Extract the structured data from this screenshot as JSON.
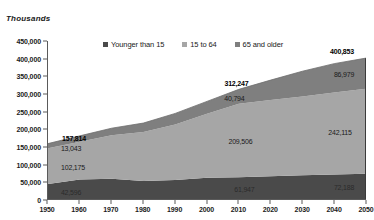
{
  "units_label": "Thousands",
  "legend": {
    "items": [
      {
        "label": "Younger than 15",
        "color": "#4a4a4a",
        "icon": "square-swatch-icon"
      },
      {
        "label": "15 to 64",
        "color": "#a6a6a6",
        "icon": "square-swatch-icon"
      },
      {
        "label": "65 and older",
        "color": "#7f7f7f",
        "icon": "square-swatch-icon"
      }
    ]
  },
  "axes": {
    "y_ticks": [
      "0",
      "50,000",
      "100,000",
      "150,000",
      "200,000",
      "250,000",
      "300,000",
      "350,000",
      "400,000",
      "450,000"
    ],
    "x_ticks": [
      "1950",
      "1960",
      "1970",
      "1980",
      "1990",
      "2000",
      "2010",
      "2020",
      "2030",
      "2040",
      "2050"
    ]
  },
  "annotations": {
    "total_1950": "157,814",
    "older_1950": "13,043",
    "middle_1950": "102,175",
    "young_1950": "42,596",
    "total_2010": "312,247",
    "older_2010": "40,794",
    "middle_2010": "209,506",
    "young_2010": "61,947",
    "total_2050": "400,853",
    "older_2050": "86,979",
    "middle_2050": "242,115",
    "young_2050": "72,188"
  },
  "chart_data": {
    "type": "area",
    "title": "",
    "subtitle": "",
    "xlabel": "",
    "ylabel": "Thousands",
    "ylim": [
      0,
      450000
    ],
    "xlim": [
      1950,
      2050
    ],
    "grid": false,
    "stacked": true,
    "legend_position": "top-center",
    "x": [
      1950,
      1960,
      1970,
      1980,
      1990,
      2000,
      2010,
      2020,
      2030,
      2040,
      2050
    ],
    "series": [
      {
        "name": "Younger than 15",
        "color": "#4a4a4a",
        "values": [
          42596,
          55784,
          57900,
          51290,
          53970,
          60253,
          61947,
          64940,
          67800,
          70100,
          72188
        ]
      },
      {
        "name": "15 to 64",
        "color": "#a6a6a6",
        "values": [
          102175,
          107500,
          123670,
          139470,
          158500,
          182800,
          209506,
          217200,
          224000,
          233500,
          242115
        ]
      },
      {
        "name": "65 and older",
        "color": "#7f7f7f",
        "values": [
          13043,
          16560,
          20066,
          25550,
          31240,
          34990,
          40794,
          56440,
          72090,
          81950,
          86979
        ]
      }
    ],
    "totals": [
      157814,
      179844,
      201636,
      216310,
      243710,
      278043,
      312247,
      338580,
      363890,
      385550,
      400853
    ],
    "annotated_points": [
      {
        "x": 1950,
        "total": 157814,
        "younger_than_15": 42596,
        "age_15_to_64": 102175,
        "age_65_and_older": 13043
      },
      {
        "x": 2010,
        "total": 312247,
        "younger_than_15": 61947,
        "age_15_to_64": 209506,
        "age_65_and_older": 40794
      },
      {
        "x": 2050,
        "total": 400853,
        "younger_than_15": 72188,
        "age_15_to_64": 242115,
        "age_65_and_older": 86979
      }
    ]
  }
}
